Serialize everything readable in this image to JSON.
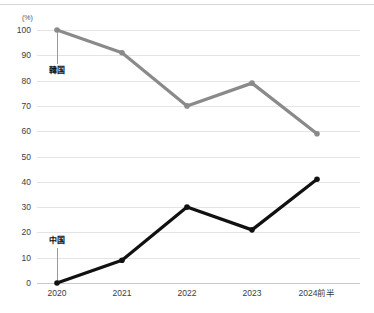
{
  "chart_data": {
    "type": "line",
    "title": "",
    "subtitle": "",
    "xlabel": "",
    "ylabel": "",
    "unit_label": "(%)",
    "categories": [
      "2020",
      "2021",
      "2022",
      "2023",
      "2024前半"
    ],
    "ylim": [
      0,
      100
    ],
    "yticks": [
      "0",
      "10",
      "20",
      "30",
      "40",
      "50",
      "60",
      "70",
      "80",
      "90",
      "100"
    ],
    "ytick_values": [
      0,
      10,
      20,
      30,
      40,
      50,
      60,
      70,
      80,
      90,
      100
    ],
    "grid": true,
    "legend_position": "inline-annotation",
    "series": [
      {
        "name": "韓国",
        "color": "#8a8a8a",
        "values": [
          100,
          91,
          70,
          79,
          59
        ],
        "annotation": {
          "label": "韓国",
          "anchor_category": "2020",
          "anchor_value": 100,
          "label_value": 83
        }
      },
      {
        "name": "中国",
        "color": "#111111",
        "values": [
          0,
          9,
          30,
          21,
          41
        ],
        "annotation": {
          "label": "中国",
          "anchor_category": "2020",
          "anchor_value": 0,
          "label_value": 16
        }
      }
    ]
  }
}
